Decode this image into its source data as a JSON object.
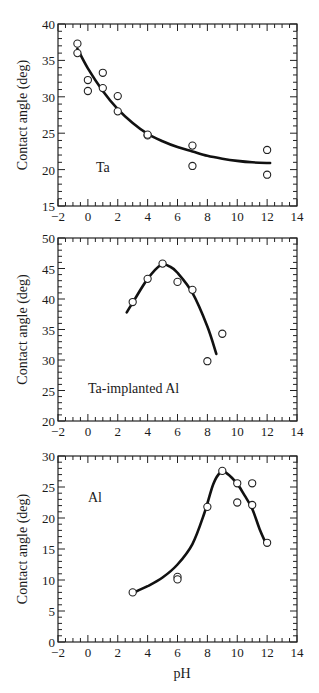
{
  "figure": {
    "shared_xlabel": "pH",
    "ylabel": "Contact angle (deg)"
  },
  "chart_data": [
    {
      "type": "scatter",
      "title": "",
      "annotation": "Ta",
      "xlabel": "",
      "ylabel": "Contact angle (deg)",
      "xlim": [
        -2,
        14
      ],
      "ylim": [
        15,
        40
      ],
      "xticks": [
        -2,
        0,
        2,
        4,
        6,
        8,
        10,
        12,
        14
      ],
      "yticks": [
        15,
        20,
        25,
        30,
        35,
        40
      ],
      "grid": false,
      "series": [
        {
          "name": "measured",
          "marker": "open-circle",
          "points": [
            [
              -0.7,
              37.3
            ],
            [
              -0.7,
              36.0
            ],
            [
              0,
              32.3
            ],
            [
              0,
              30.8
            ],
            [
              1,
              33.3
            ],
            [
              1,
              31.2
            ],
            [
              2,
              30.1
            ],
            [
              2,
              28.0
            ],
            [
              4,
              24.7
            ],
            [
              4,
              24.8
            ],
            [
              7,
              23.3
            ],
            [
              7,
              20.5
            ],
            [
              12,
              22.7
            ],
            [
              12,
              19.3
            ]
          ]
        },
        {
          "name": "fit",
          "style": "line",
          "points": [
            [
              -0.7,
              36.6
            ],
            [
              0,
              33.9
            ],
            [
              1,
              30.8
            ],
            [
              2,
              28.3
            ],
            [
              3,
              26.4
            ],
            [
              4,
              24.9
            ],
            [
              5,
              23.9
            ],
            [
              6,
              23.1
            ],
            [
              7,
              22.5
            ],
            [
              8,
              21.9
            ],
            [
              9,
              21.5
            ],
            [
              10,
              21.2
            ],
            [
              11,
              21.0
            ],
            [
              12.2,
              20.9
            ]
          ]
        }
      ]
    },
    {
      "type": "scatter",
      "title": "",
      "annotation": "Ta-implanted Al",
      "xlabel": "",
      "ylabel": "Contact angle (deg)",
      "xlim": [
        -2,
        14
      ],
      "ylim": [
        20,
        50
      ],
      "xticks": [
        -2,
        0,
        2,
        4,
        6,
        8,
        10,
        12,
        14
      ],
      "yticks": [
        20,
        25,
        30,
        35,
        40,
        45,
        50
      ],
      "grid": false,
      "series": [
        {
          "name": "measured",
          "marker": "open-circle",
          "points": [
            [
              3,
              39.5
            ],
            [
              4,
              43.3
            ],
            [
              5,
              45.8
            ],
            [
              6,
              42.8
            ],
            [
              7,
              41.5
            ],
            [
              8,
              29.8
            ],
            [
              9,
              34.3
            ]
          ]
        },
        {
          "name": "fit",
          "style": "line",
          "points": [
            [
              2.6,
              37.8
            ],
            [
              3,
              39.4
            ],
            [
              4,
              43.3
            ],
            [
              4.9,
              45.6
            ],
            [
              5.5,
              45.3
            ],
            [
              6,
              44.3
            ],
            [
              7,
              41.0
            ],
            [
              8,
              35.5
            ],
            [
              8.6,
              31.0
            ]
          ]
        }
      ]
    },
    {
      "type": "scatter",
      "title": "",
      "annotation": "Al",
      "xlabel": "pH",
      "ylabel": "Contact angle (deg)",
      "xlim": [
        -2,
        14
      ],
      "ylim": [
        0,
        30
      ],
      "xticks": [
        -2,
        0,
        2,
        4,
        6,
        8,
        10,
        12,
        14
      ],
      "yticks": [
        0,
        5,
        10,
        15,
        20,
        25,
        30
      ],
      "grid": false,
      "series": [
        {
          "name": "measured",
          "marker": "open-circle",
          "points": [
            [
              3,
              8.0
            ],
            [
              6,
              10.5
            ],
            [
              6,
              10.1
            ],
            [
              8,
              21.8
            ],
            [
              9,
              27.6
            ],
            [
              10,
              25.6
            ],
            [
              10,
              22.5
            ],
            [
              11,
              25.6
            ],
            [
              11,
              22.1
            ],
            [
              12,
              16.0
            ]
          ]
        },
        {
          "name": "fit",
          "style": "line",
          "points": [
            [
              3,
              7.9
            ],
            [
              4,
              9.0
            ],
            [
              5,
              10.4
            ],
            [
              6,
              12.5
            ],
            [
              7,
              15.8
            ],
            [
              7.8,
              20.8
            ],
            [
              8.4,
              25.5
            ],
            [
              8.9,
              27.4
            ],
            [
              9.3,
              27.2
            ],
            [
              10,
              25.5
            ],
            [
              10.5,
              23.6
            ],
            [
              11,
              21.5
            ],
            [
              11.5,
              18.2
            ],
            [
              11.9,
              16.0
            ]
          ]
        }
      ]
    }
  ]
}
